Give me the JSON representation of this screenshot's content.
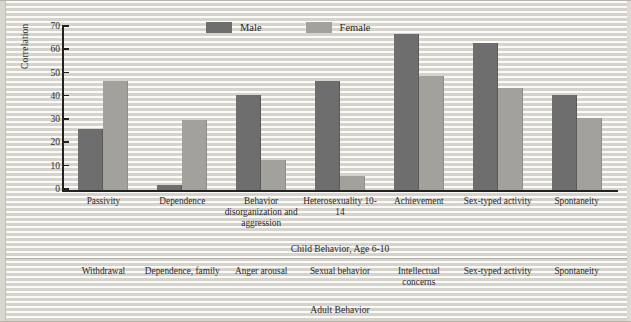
{
  "chart_data": {
    "type": "bar",
    "title": "",
    "xlabel": "Child Behavior, Age 6-10",
    "ylabel": "Correlation",
    "ylim": [
      0,
      70
    ],
    "yticks": [
      0,
      10,
      20,
      30,
      40,
      50,
      60,
      70
    ],
    "grid": false,
    "legend_position": "top-center",
    "categories": [
      "Passivity",
      "Dependence",
      "Behavior disorganization and aggression",
      "Heterosexuality 10-14",
      "Achievement",
      "Sex-typed activity",
      "Spontaneity"
    ],
    "series": [
      {
        "name": "Male",
        "color": "#6e6e6e",
        "values": [
          26,
          2,
          41,
          47,
          67,
          63,
          41
        ]
      },
      {
        "name": "Female",
        "color": "#a2a19c",
        "values": [
          47,
          30,
          13,
          6,
          49,
          44,
          31
        ]
      }
    ]
  },
  "legend": {
    "items": [
      {
        "label": "Male",
        "color": "#6e6e6e"
      },
      {
        "label": "Female",
        "color": "#a2a19c"
      }
    ]
  },
  "axis": {
    "y_title": "Correlation",
    "y_ticks": [
      "70",
      "60",
      "50",
      "40",
      "30",
      "20",
      "10",
      "0"
    ]
  },
  "child_row": {
    "caption": "Child Behavior, Age 6-10",
    "labels": [
      "Passivity",
      "Dependence",
      "Behavior disorganization and aggression",
      "Heterosexuality 10-14",
      "Achievement",
      "Sex-typed activity",
      "Spontaneity"
    ]
  },
  "adult_row": {
    "caption": "Adult Behavior",
    "labels": [
      "Withdrawal",
      "Dependence, family",
      "Anger arousal",
      "Sexual behavior",
      "Intellectual concerns",
      "Sex-typed activity",
      "Spontaneity"
    ]
  }
}
